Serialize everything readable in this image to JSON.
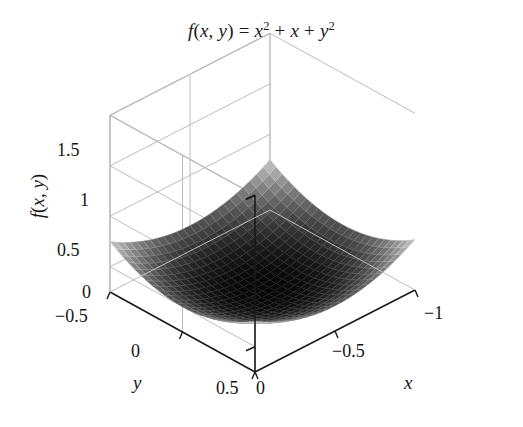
{
  "figure": {
    "title_plain": "f(x, y) = x^2 + x + y^2",
    "background_color": "#ffffff",
    "axis_color": "#1a1a1a",
    "grid_color": "#bdbdbd",
    "surface_dark": "#0a0a0a",
    "surface_light": "#c8c8c8"
  },
  "title": {
    "f": "f",
    "open": "(",
    "x": "x",
    "comma": ", ",
    "y": "y",
    "close": ")",
    "equals": " = ",
    "term1_base": "x",
    "term1_exp": "2",
    "plus1": " + ",
    "term2": "x",
    "plus2": " + ",
    "term3_base": "y",
    "term3_exp": "2"
  },
  "axes": {
    "x_label": "x",
    "y_label": "y",
    "z_label_f": "f",
    "z_label_open": "(",
    "z_label_x": "x",
    "z_label_comma": ", ",
    "z_label_y": "y",
    "z_label_close": ")",
    "x_ticks": [
      "0",
      "−0.5",
      "−1"
    ],
    "y_ticks": [
      "−0.5",
      "0",
      "0.5"
    ],
    "z_ticks": [
      "0",
      "0.5",
      "1",
      "1.5"
    ]
  },
  "chart_data": {
    "type": "surface",
    "xlabel": "x",
    "ylabel": "y",
    "zlabel": "f(x, y)",
    "function": "x^2 + x + y^2",
    "xlim": [
      -1,
      0
    ],
    "ylim": [
      -0.5,
      0.5
    ],
    "zlim": [
      -0.25,
      1.5
    ],
    "xticks": [
      0,
      -0.5,
      -1
    ],
    "yticks": [
      -0.5,
      0,
      0.5
    ],
    "zticks": [
      0,
      0.5,
      1,
      1.5
    ],
    "grid": true,
    "legend": false,
    "colormap": "grayscale",
    "mesh_n": 24,
    "view_azimuth_deg": 45,
    "view_elevation_deg": 22,
    "minimum": {
      "x": -0.5,
      "y": 0,
      "z": -0.25
    },
    "corners": [
      {
        "x": -1,
        "y": -0.5,
        "z": 0.25
      },
      {
        "x": -1,
        "y": 0.5,
        "z": 0.25
      },
      {
        "x": 0,
        "y": -0.5,
        "z": 0.25
      },
      {
        "x": 0,
        "y": 0.5,
        "z": 0.25
      }
    ]
  }
}
